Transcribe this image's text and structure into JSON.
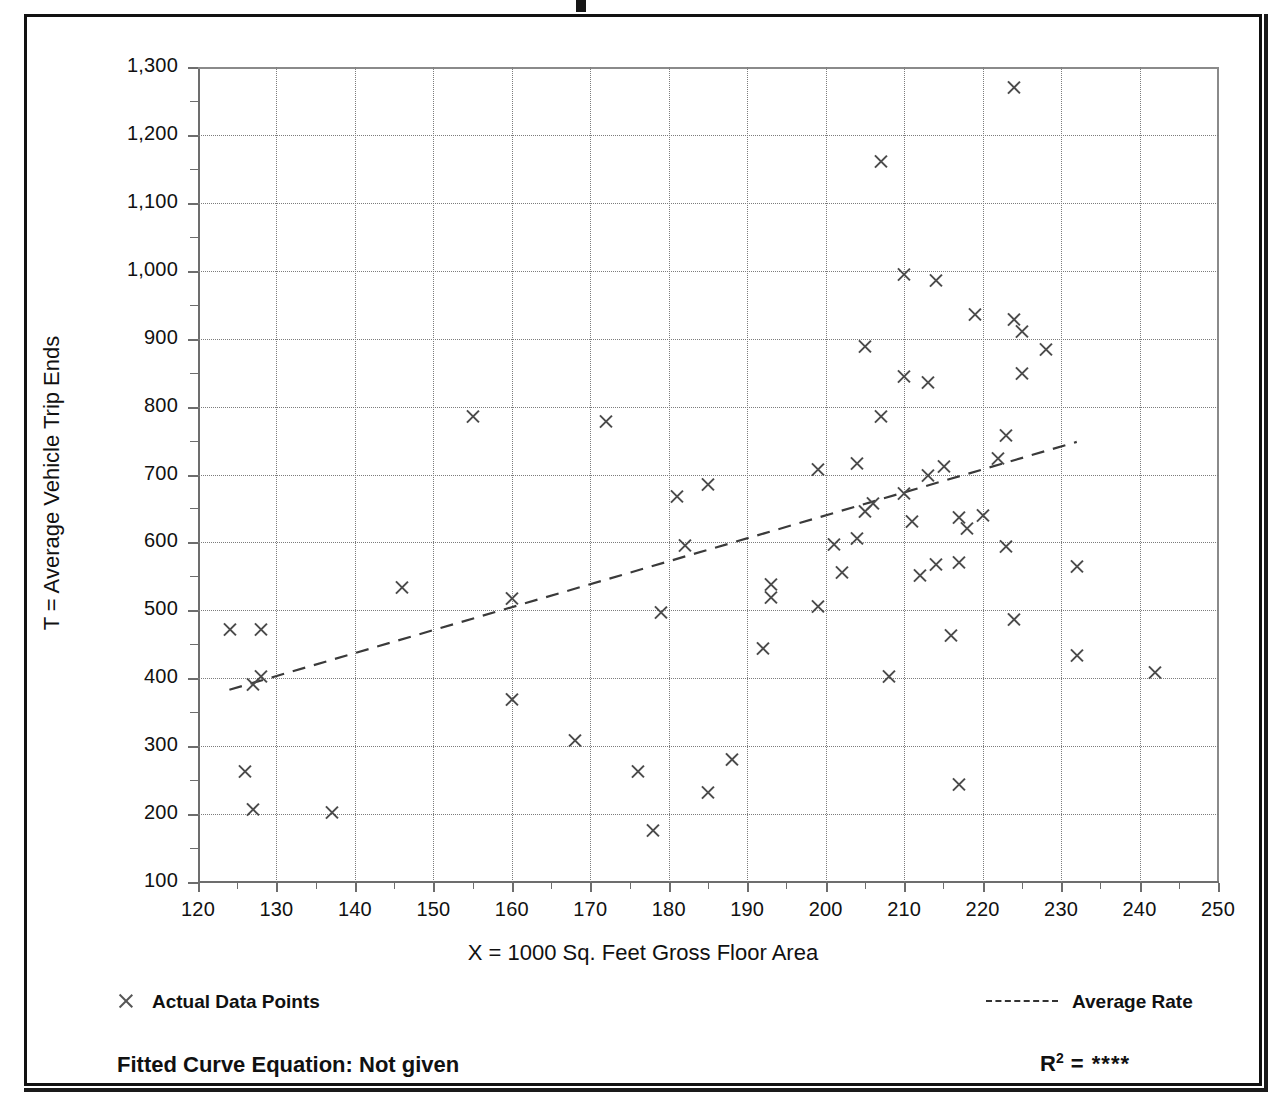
{
  "chart_data": {
    "type": "scatter",
    "title": "",
    "xlabel": "X = 1000 Sq. Feet Gross Floor Area",
    "ylabel": "T = Average Vehicle Trip Ends",
    "xlim": [
      120,
      250
    ],
    "ylim": [
      100,
      1300
    ],
    "xticks": [
      120,
      130,
      140,
      150,
      160,
      170,
      180,
      190,
      200,
      210,
      220,
      230,
      240,
      250
    ],
    "yticks": [
      100,
      200,
      300,
      400,
      500,
      600,
      700,
      800,
      900,
      1000,
      1100,
      1200,
      1300
    ],
    "xtick_labels": [
      "120",
      "130",
      "140",
      "150",
      "160",
      "170",
      "180",
      "190",
      "200",
      "210",
      "220",
      "230",
      "240",
      "250"
    ],
    "ytick_labels": [
      "100",
      "200",
      "300",
      "400",
      "500",
      "600",
      "700",
      "800",
      "900",
      "1,000",
      "1,100",
      "1,200",
      "1,300"
    ],
    "grid": true,
    "grid_style": "dotted",
    "marker": "x",
    "series": [
      {
        "name": "Actual Data Points",
        "points": [
          [
            124,
            472
          ],
          [
            126,
            262
          ],
          [
            127,
            207
          ],
          [
            127,
            391
          ],
          [
            128,
            403
          ],
          [
            128,
            472
          ],
          [
            137,
            203
          ],
          [
            146,
            533
          ],
          [
            155,
            786
          ],
          [
            160,
            518
          ],
          [
            160,
            368
          ],
          [
            168,
            308
          ],
          [
            172,
            778
          ],
          [
            176,
            262
          ],
          [
            178,
            176
          ],
          [
            179,
            497
          ],
          [
            181,
            667
          ],
          [
            182,
            595
          ],
          [
            185,
            685
          ],
          [
            185,
            232
          ],
          [
            188,
            281
          ],
          [
            192,
            444
          ],
          [
            193,
            538
          ],
          [
            193,
            519
          ],
          [
            199,
            708
          ],
          [
            199,
            505
          ],
          [
            201,
            597
          ],
          [
            202,
            556
          ],
          [
            204,
            716
          ],
          [
            204,
            606
          ],
          [
            205,
            888
          ],
          [
            205,
            646
          ],
          [
            206,
            658
          ],
          [
            207,
            1161
          ],
          [
            207,
            786
          ],
          [
            208,
            403
          ],
          [
            210,
            672
          ],
          [
            210,
            995
          ],
          [
            210,
            845
          ],
          [
            211,
            631
          ],
          [
            212,
            552
          ],
          [
            213,
            836
          ],
          [
            213,
            698
          ],
          [
            214,
            985
          ],
          [
            214,
            568
          ],
          [
            215,
            712
          ],
          [
            216,
            463
          ],
          [
            217,
            637
          ],
          [
            217,
            244
          ],
          [
            217,
            570
          ],
          [
            218,
            620
          ],
          [
            219,
            935
          ],
          [
            220,
            639
          ],
          [
            222,
            723
          ],
          [
            223,
            757
          ],
          [
            223,
            594
          ],
          [
            224,
            1270
          ],
          [
            224,
            928
          ],
          [
            224,
            487
          ],
          [
            225,
            911
          ],
          [
            225,
            848
          ],
          [
            228,
            884
          ],
          [
            232,
            565
          ],
          [
            232,
            434
          ],
          [
            242,
            409
          ]
        ]
      }
    ],
    "trend_line": {
      "name": "Average Rate",
      "style": "dashed",
      "x_start": 124,
      "y_start": 383,
      "x_end": 232,
      "y_end": 748
    },
    "annotations": {
      "fitted_curve_equation": "Fitted Curve Equation:  Not given",
      "r_squared_label": "R",
      "r_squared_exponent": "2",
      "r_squared_value": "= ****"
    }
  },
  "legend": {
    "data_points_label": "Actual Data Points",
    "average_rate_label": "Average Rate",
    "marker_icon": "x-marker-icon",
    "line_icon": "dashed-line-icon"
  },
  "footer": {
    "equation_text": "Fitted Curve Equation:  Not given",
    "r2_prefix": "R",
    "r2_sup": "2",
    "r2_rest": " = ****"
  }
}
